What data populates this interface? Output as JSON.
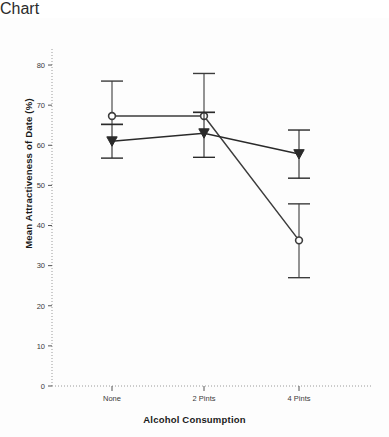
{
  "chart_data": {
    "type": "line",
    "title": "",
    "subtitle": "",
    "xlabel": "Alcohol Consumption",
    "ylabel": "Mean Attractiveness of Date (%)",
    "categories": [
      "None",
      "2 Pints",
      "4 Pints"
    ],
    "ylim": [
      0,
      84
    ],
    "xlim": [
      0,
      3
    ],
    "yticks": [
      0,
      10,
      20,
      30,
      40,
      50,
      60,
      70,
      80
    ],
    "ytick_labels": [
      "0",
      "10",
      "20",
      "30",
      "40",
      "50",
      "60",
      "70",
      "80"
    ],
    "grid": false,
    "legend": "none",
    "axis_style": "dotted",
    "error_bar_type": "95% CI",
    "series": [
      {
        "name": "Circle series",
        "marker": "circle-open",
        "color": "#3c3c3c",
        "values": [
          67.3,
          67.3,
          36.3
        ],
        "err_low": [
          65.2,
          68.2,
          45.4
        ],
        "err_high": [
          76.0,
          77.9,
          27.0
        ],
        "ci_upper": [
          76.0,
          77.9,
          45.4
        ],
        "ci_lower": [
          65.2,
          68.2,
          27.0
        ]
      },
      {
        "name": "Triangle series",
        "marker": "triangle-down-filled",
        "color": "#2a2a2a",
        "values": [
          61.0,
          63.0,
          57.8
        ],
        "ci_upper": [
          65.2,
          68.2,
          63.8
        ],
        "ci_lower": [
          56.8,
          57.0,
          51.8
        ]
      }
    ],
    "annotations": []
  },
  "colors": {
    "axis": "#9a9a9a",
    "line": "#3a3a3a",
    "marker_fill": "#ffffff",
    "text": "#1a1a1a",
    "background": "#fdfdfd"
  }
}
